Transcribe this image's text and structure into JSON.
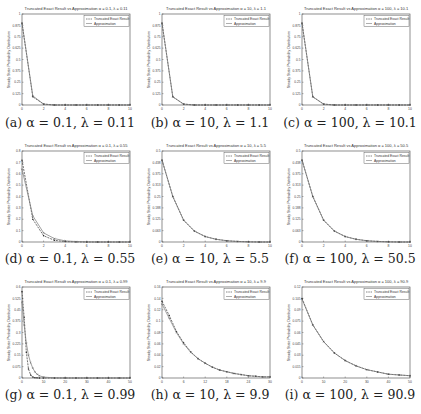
{
  "figure": {
    "panels": [
      {
        "id": "a",
        "caption": "(a) α = 0.1, λ = 0.11",
        "title": "Truncated Exact Result vs Approximation α = 0.1, λ = 0.11"
      },
      {
        "id": "b",
        "caption": "(b) α = 10, λ = 1.1",
        "title": "Truncated Exact Result vs Approximation α = 10, λ = 1.1"
      },
      {
        "id": "c",
        "caption": "(c) α = 100, λ = 10.1",
        "title": "Truncated Exact Result vs Approximation α = 100, λ = 10.1"
      },
      {
        "id": "d",
        "caption": "(d) α = 0.1, λ = 0.55",
        "title": "Truncated Exact Result vs Approximation α = 0.1, λ = 0.55"
      },
      {
        "id": "e",
        "caption": "(e) α = 10, λ = 5.5",
        "title": "Truncated Exact Result vs Approximation α = 10, λ = 5.5"
      },
      {
        "id": "f",
        "caption": "(f) α = 100, λ = 50.5",
        "title": "Truncated Exact Result vs Approximation α = 100, λ = 50.5"
      },
      {
        "id": "g",
        "caption": "(g) α = 0.1, λ = 0.99",
        "title": "Truncated Exact Result vs Approximation α = 0.1, λ = 0.99"
      },
      {
        "id": "h",
        "caption": "(h) α = 10, λ = 9.9",
        "title": "Truncated Exact Result vs Approximation α = 10, λ = 9.9"
      },
      {
        "id": "i",
        "caption": "(i) α = 100, λ = 90.9",
        "title": "Truncated Exact Result vs Approximation α = 100, λ = 90.9"
      }
    ],
    "legend": [
      "Truncated Exact Result",
      "Approximation"
    ],
    "ylabel": "Steady State Probability Distribution",
    "xlabel": "n"
  },
  "chart_data": [
    {
      "type": "line",
      "title": "Truncated Exact Result vs Approximation α = 0.1, λ = 0.11",
      "xlabel": "n",
      "ylabel": "Steady State Probability Distribution",
      "xlim": [
        0,
        10
      ],
      "ylim": [
        0,
        1
      ],
      "x": [
        0,
        1,
        2,
        3,
        4,
        5,
        6,
        7,
        8,
        9,
        10
      ],
      "series": [
        {
          "name": "Truncated Exact Result",
          "values": [
            0.9,
            0.09,
            0.01,
            0,
            0,
            0,
            0,
            0,
            0,
            0,
            0
          ]
        },
        {
          "name": "Approximation",
          "values": [
            0.9,
            0.1,
            0.01,
            0,
            0,
            0,
            0,
            0,
            0,
            0,
            0
          ]
        }
      ],
      "legend_position": "upper right"
    },
    {
      "type": "line",
      "title": "Truncated Exact Result vs Approximation α = 10, λ = 1.1",
      "xlabel": "n",
      "ylabel": "Steady State Probability Distribution",
      "xlim": [
        0,
        10
      ],
      "ylim": [
        0,
        1
      ],
      "x": [
        0,
        1,
        2,
        3,
        4,
        5,
        6,
        7,
        8,
        9,
        10
      ],
      "series": [
        {
          "name": "Truncated Exact Result",
          "values": [
            0.9,
            0.09,
            0.01,
            0,
            0,
            0,
            0,
            0,
            0,
            0,
            0
          ]
        },
        {
          "name": "Approximation",
          "values": [
            0.9,
            0.09,
            0.01,
            0,
            0,
            0,
            0,
            0,
            0,
            0,
            0
          ]
        }
      ],
      "legend_position": "upper right"
    },
    {
      "type": "line",
      "title": "Truncated Exact Result vs Approximation α = 100, λ = 10.1",
      "xlabel": "n",
      "ylabel": "Steady State Probability Distribution",
      "xlim": [
        0,
        10
      ],
      "ylim": [
        0,
        1
      ],
      "x": [
        0,
        1,
        2,
        3,
        4,
        5,
        6,
        7,
        8,
        9,
        10
      ],
      "series": [
        {
          "name": "Truncated Exact Result",
          "values": [
            0.9,
            0.09,
            0.01,
            0,
            0,
            0,
            0,
            0,
            0,
            0,
            0
          ]
        },
        {
          "name": "Approximation",
          "values": [
            0.9,
            0.09,
            0.01,
            0,
            0,
            0,
            0,
            0,
            0,
            0,
            0
          ]
        }
      ],
      "legend_position": "upper right"
    },
    {
      "type": "line",
      "title": "Truncated Exact Result vs Approximation α = 0.1, λ = 0.55",
      "xlabel": "n",
      "ylabel": "Steady State Probability Distribution",
      "xlim": [
        0,
        10
      ],
      "ylim": [
        0,
        0.8
      ],
      "x": [
        0,
        1,
        2,
        3,
        4,
        5,
        6,
        7,
        8,
        9,
        10
      ],
      "series": [
        {
          "name": "Truncated Exact Result",
          "values": [
            0.72,
            0.2,
            0.055,
            0.015,
            0.004,
            0.001,
            0,
            0,
            0,
            0,
            0
          ]
        },
        {
          "name": "Approximation",
          "values": [
            0.64,
            0.23,
            0.08,
            0.03,
            0.01,
            0.004,
            0.001,
            0,
            0,
            0,
            0
          ]
        }
      ],
      "legend_position": "upper right"
    },
    {
      "type": "line",
      "title": "Truncated Exact Result vs Approximation α = 10, λ = 5.5",
      "xlabel": "n",
      "ylabel": "Steady State Probability Distribution",
      "xlim": [
        0,
        10
      ],
      "ylim": [
        0,
        0.5
      ],
      "x": [
        0,
        1,
        2,
        3,
        4,
        5,
        6,
        7,
        8,
        9,
        10
      ],
      "series": [
        {
          "name": "Truncated Exact Result",
          "values": [
            0.45,
            0.25,
            0.12,
            0.06,
            0.03,
            0.015,
            0.007,
            0.003,
            0.001,
            0,
            0
          ]
        },
        {
          "name": "Approximation",
          "values": [
            0.45,
            0.25,
            0.12,
            0.06,
            0.03,
            0.015,
            0.007,
            0.003,
            0.001,
            0,
            0
          ]
        }
      ],
      "legend_position": "upper right"
    },
    {
      "type": "line",
      "title": "Truncated Exact Result vs Approximation α = 100, λ = 50.5",
      "xlabel": "n",
      "ylabel": "Steady State Probability Distribution",
      "xlim": [
        0,
        10
      ],
      "ylim": [
        0,
        0.5
      ],
      "x": [
        0,
        1,
        2,
        3,
        4,
        5,
        6,
        7,
        8,
        9,
        10
      ],
      "series": [
        {
          "name": "Truncated Exact Result",
          "values": [
            0.45,
            0.25,
            0.12,
            0.06,
            0.03,
            0.015,
            0.007,
            0.003,
            0.001,
            0,
            0
          ]
        },
        {
          "name": "Approximation",
          "values": [
            0.45,
            0.25,
            0.12,
            0.06,
            0.03,
            0.015,
            0.007,
            0.003,
            0.001,
            0,
            0
          ]
        }
      ],
      "legend_position": "upper right"
    },
    {
      "type": "line",
      "title": "Truncated Exact Result vs Approximation α = 0.1, λ = 0.99",
      "xlabel": "n",
      "ylabel": "Steady State Probability Distribution",
      "xlim": [
        0,
        50
      ],
      "ylim": [
        0,
        0.6
      ],
      "x": [
        0,
        1,
        2,
        3,
        4,
        5,
        6,
        7,
        8,
        10,
        15,
        20,
        25,
        30,
        35,
        40,
        45,
        50
      ],
      "series": [
        {
          "name": "Truncated Exact Result",
          "values": [
            0.57,
            0.4,
            0.17,
            0.06,
            0.02,
            0.007,
            0.002,
            0.001,
            0,
            0,
            0,
            0,
            0,
            0,
            0,
            0,
            0,
            0
          ]
        },
        {
          "name": "Approximation",
          "values": [
            0.5,
            0.35,
            0.23,
            0.15,
            0.1,
            0.065,
            0.04,
            0.025,
            0.015,
            0.006,
            0.001,
            0,
            0,
            0,
            0,
            0,
            0,
            0
          ]
        }
      ],
      "legend_position": "upper right"
    },
    {
      "type": "line",
      "title": "Truncated Exact Result vs Approximation α = 10, λ = 9.9",
      "xlabel": "n",
      "ylabel": "Steady State Probability Distribution",
      "xlim": [
        0,
        30
      ],
      "ylim": [
        0,
        0.16
      ],
      "x": [
        0,
        2,
        4,
        6,
        8,
        10,
        12,
        14,
        16,
        18,
        20,
        22,
        24,
        26,
        28,
        30
      ],
      "series": [
        {
          "name": "Truncated Exact Result",
          "values": [
            0.135,
            0.11,
            0.082,
            0.062,
            0.046,
            0.034,
            0.026,
            0.019,
            0.014,
            0.011,
            0.008,
            0.006,
            0.004,
            0.003,
            0.002,
            0.002
          ]
        },
        {
          "name": "Approximation",
          "values": [
            0.13,
            0.105,
            0.08,
            0.06,
            0.045,
            0.034,
            0.026,
            0.019,
            0.014,
            0.011,
            0.008,
            0.006,
            0.004,
            0.003,
            0.002,
            0.002
          ]
        }
      ],
      "legend_position": "upper right"
    },
    {
      "type": "line",
      "title": "Truncated Exact Result vs Approximation α = 100, λ = 90.9",
      "xlabel": "n",
      "ylabel": "Steady State Probability Distribution",
      "xlim": [
        0,
        50
      ],
      "ylim": [
        0,
        0.12
      ],
      "x": [
        0,
        5,
        10,
        15,
        20,
        25,
        30,
        35,
        40,
        45,
        50
      ],
      "series": [
        {
          "name": "Truncated Exact Result",
          "values": [
            0.105,
            0.07,
            0.048,
            0.033,
            0.023,
            0.016,
            0.011,
            0.008,
            0.005,
            0.004,
            0.003
          ]
        },
        {
          "name": "Approximation",
          "values": [
            0.104,
            0.07,
            0.048,
            0.033,
            0.023,
            0.016,
            0.011,
            0.008,
            0.005,
            0.004,
            0.003
          ]
        }
      ],
      "legend_position": "upper right"
    }
  ]
}
